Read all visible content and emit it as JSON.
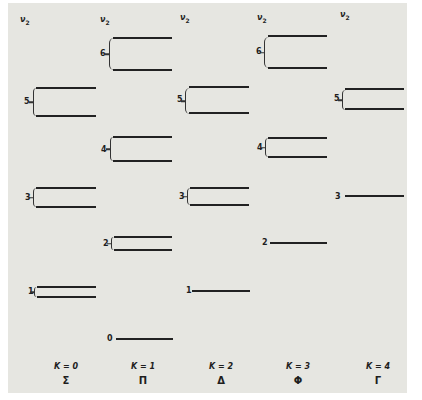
{
  "diagram": {
    "axis_label": "ν2",
    "columns": [
      {
        "K": "K = 0",
        "symbol": "Σ",
        "levels": [
          {
            "v": "5",
            "type": "pair",
            "y": [
              87,
              116
            ]
          },
          {
            "v": "3",
            "type": "pair",
            "y": [
              188,
              207
            ]
          },
          {
            "v": "1",
            "type": "pair",
            "y": [
              287,
              297
            ]
          }
        ]
      },
      {
        "K": "K = 1",
        "symbol": "Π",
        "levels": [
          {
            "v": "6",
            "type": "pair",
            "y": [
              37,
              70
            ]
          },
          {
            "v": "4",
            "type": "pair",
            "y": [
              137,
              161
            ]
          },
          {
            "v": "2",
            "type": "pair",
            "y": [
              237,
              250
            ]
          },
          {
            "v": "0",
            "type": "single",
            "y": [
              339
            ]
          }
        ]
      },
      {
        "K": "K = 2",
        "symbol": "Δ",
        "levels": [
          {
            "v": "5",
            "type": "pair",
            "y": [
              87,
              113
            ]
          },
          {
            "v": "3",
            "type": "pair",
            "y": [
              188,
              205
            ]
          },
          {
            "v": "1",
            "type": "single",
            "y": [
              291
            ]
          }
        ]
      },
      {
        "K": "K = 3",
        "symbol": "Φ",
        "levels": [
          {
            "v": "6",
            "type": "pair",
            "y": [
              36,
              68
            ]
          },
          {
            "v": "4",
            "type": "pair",
            "y": [
              138,
              157
            ]
          },
          {
            "v": "2",
            "type": "single",
            "y": [
              243
            ]
          }
        ]
      },
      {
        "K": "K = 4",
        "symbol": "Γ",
        "levels": [
          {
            "v": "5",
            "type": "pair",
            "y": [
              89,
              109
            ]
          },
          {
            "v": "3",
            "type": "single",
            "y": [
              196
            ]
          }
        ]
      }
    ]
  },
  "labels": {
    "nu": "ν",
    "nu_sub": "2",
    "col0_k": "K = 0",
    "col0_sym": "Σ",
    "col1_k": "K = 1",
    "col1_sym": "Π",
    "col2_k": "K = 2",
    "col2_sym": "Δ",
    "col3_k": "K = 3",
    "col3_sym": "Φ",
    "col4_k": "K = 4",
    "col4_sym": "Γ",
    "c0_l5": "5",
    "c0_l3": "3",
    "c0_l1": "1",
    "c1_l6": "6",
    "c1_l4": "4",
    "c1_l2": "2",
    "c1_l0": "0",
    "c2_l5": "5",
    "c2_l3": "3",
    "c2_l1": "1",
    "c3_l6": "6",
    "c3_l4": "4",
    "c3_l2": "2",
    "c4_l5": "5",
    "c4_l3": "3"
  }
}
